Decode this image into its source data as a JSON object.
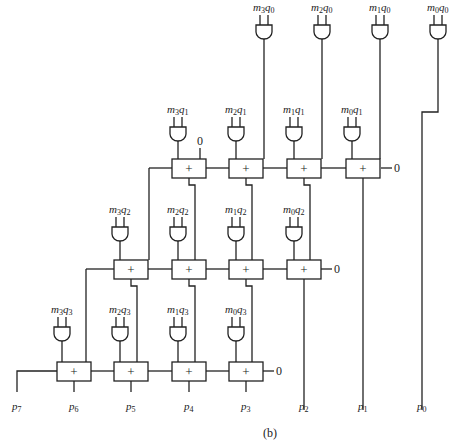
{
  "caption": "(b)",
  "and_gates": [
    {
      "row": 0,
      "labels": [
        {
          "m": "3",
          "q": "0"
        },
        {
          "m": "2",
          "q": "0"
        },
        {
          "m": "1",
          "q": "0"
        },
        {
          "m": "0",
          "q": "0"
        }
      ]
    },
    {
      "row": 1,
      "labels": [
        {
          "m": "3",
          "q": "1"
        },
        {
          "m": "2",
          "q": "1"
        },
        {
          "m": "1",
          "q": "1"
        },
        {
          "m": "0",
          "q": "1"
        }
      ]
    },
    {
      "row": 2,
      "labels": [
        {
          "m": "3",
          "q": "2"
        },
        {
          "m": "2",
          "q": "2"
        },
        {
          "m": "1",
          "q": "2"
        },
        {
          "m": "0",
          "q": "2"
        }
      ]
    },
    {
      "row": 3,
      "labels": [
        {
          "m": "3",
          "q": "3"
        },
        {
          "m": "2",
          "q": "3"
        },
        {
          "m": "1",
          "q": "3"
        },
        {
          "m": "0",
          "q": "3"
        }
      ]
    }
  ],
  "adder_symbol": "+",
  "carry_in": "0",
  "outputs": [
    "p7",
    "p6",
    "p5",
    "p4",
    "p3",
    "p2",
    "p1",
    "p0"
  ]
}
